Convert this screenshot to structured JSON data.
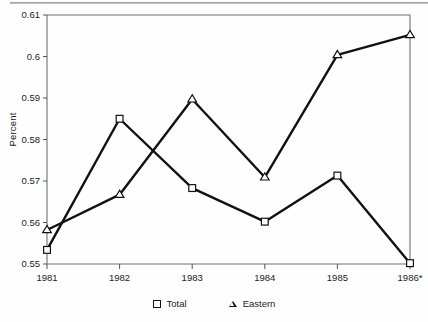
{
  "chart_data": {
    "type": "line",
    "title": "",
    "xlabel": "",
    "ylabel": "Percent",
    "categories": [
      "1981",
      "1982",
      "1983",
      "1984",
      "1985",
      "1986*"
    ],
    "xtick_labels": [
      "1981",
      "1982",
      "1983",
      "1984",
      "1985",
      "1986*"
    ],
    "ytick_labels": [
      "0.61",
      "0.6",
      "0.59",
      "0.58",
      "0.57",
      "0.56",
      "0.55"
    ],
    "ytick_values": [
      0.61,
      0.6,
      0.59,
      0.58,
      0.57,
      0.56,
      0.55
    ],
    "ylim": [
      0.55,
      0.61
    ],
    "grid": false,
    "legend_position": "bottom",
    "series": [
      {
        "name": "Total",
        "marker": "open-square",
        "values": [
          0.5534,
          0.585,
          0.5683,
          0.5602,
          0.5713,
          0.5502
        ]
      },
      {
        "name": "Eastern",
        "marker": "open-triangle",
        "values": [
          0.5582,
          0.5667,
          0.5897,
          0.5709,
          0.6004,
          0.6052
        ]
      }
    ]
  },
  "axis": {
    "ylabel": "Percent"
  },
  "legend": {
    "items": [
      {
        "label": "Total",
        "marker": "square-marker-icon"
      },
      {
        "label": "Eastern",
        "marker": "triangle-marker-icon"
      }
    ]
  }
}
